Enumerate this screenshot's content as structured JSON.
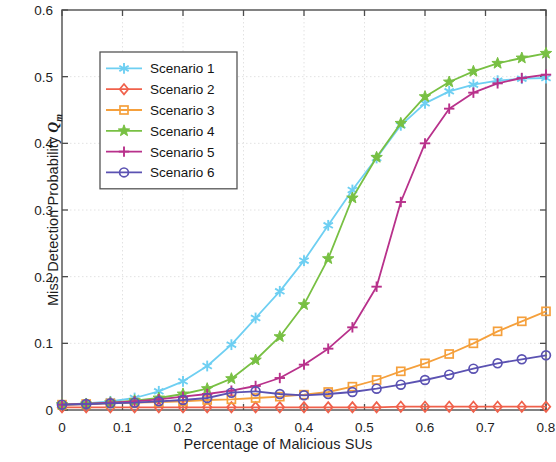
{
  "chart_data": {
    "type": "line",
    "title": "",
    "xlabel": "Percentage of Malicious SUs",
    "ylabel": "Miss Detection Probability",
    "ylabel_symbol": "Q",
    "ylabel_symbol_sub": "m",
    "xlim": [
      0,
      0.8
    ],
    "ylim": [
      0,
      0.6
    ],
    "xticks": [
      0,
      0.1,
      0.2,
      0.3,
      0.4,
      0.5,
      0.6,
      0.7,
      0.8
    ],
    "xtick_labels": [
      "0",
      "0.1",
      "0.2",
      "0.3",
      "0.4",
      "0.5",
      "0.6",
      "0.7",
      "0.8"
    ],
    "yticks": [
      0,
      0.1,
      0.2,
      0.3,
      0.4,
      0.5,
      0.6
    ],
    "ytick_labels": [
      "0",
      "0.1",
      "0.2",
      "0.3",
      "0.4",
      "0.5",
      "0.6"
    ],
    "grid": true,
    "legend_position": "upper-left-inset",
    "x": [
      0,
      0.04,
      0.08,
      0.12,
      0.16,
      0.2,
      0.24,
      0.28,
      0.32,
      0.36,
      0.4,
      0.44,
      0.48,
      0.52,
      0.56,
      0.6,
      0.64,
      0.68,
      0.72,
      0.76,
      0.8
    ],
    "series": [
      {
        "name": "Scenario 1",
        "color": "#6ecff2",
        "marker": "asterisk",
        "values": [
          0.008,
          0.01,
          0.013,
          0.018,
          0.028,
          0.043,
          0.066,
          0.098,
          0.138,
          0.178,
          0.224,
          0.277,
          0.33,
          0.378,
          0.427,
          0.46,
          0.478,
          0.488,
          0.494,
          0.497,
          0.498
        ]
      },
      {
        "name": "Scenario 2",
        "color": "#f0614b",
        "marker": "diamond",
        "values": [
          0.004,
          0.004,
          0.004,
          0.004,
          0.004,
          0.004,
          0.004,
          0.004,
          0.004,
          0.004,
          0.004,
          0.004,
          0.004,
          0.004,
          0.005,
          0.005,
          0.005,
          0.005,
          0.005,
          0.005,
          0.005
        ]
      },
      {
        "name": "Scenario 3",
        "color": "#f5a03c",
        "marker": "square",
        "values": [
          0.008,
          0.009,
          0.01,
          0.011,
          0.012,
          0.013,
          0.015,
          0.016,
          0.018,
          0.02,
          0.023,
          0.027,
          0.035,
          0.045,
          0.058,
          0.07,
          0.084,
          0.1,
          0.118,
          0.133,
          0.148
        ]
      },
      {
        "name": "Scenario 4",
        "color": "#78c043",
        "marker": "star",
        "values": [
          0.008,
          0.009,
          0.011,
          0.014,
          0.018,
          0.024,
          0.032,
          0.047,
          0.075,
          0.11,
          0.158,
          0.227,
          0.318,
          0.379,
          0.43,
          0.47,
          0.492,
          0.508,
          0.52,
          0.528,
          0.535
        ]
      },
      {
        "name": "Scenario 5",
        "color": "#b8318b",
        "marker": "plus",
        "values": [
          0.008,
          0.009,
          0.011,
          0.013,
          0.016,
          0.02,
          0.024,
          0.029,
          0.036,
          0.048,
          0.068,
          0.092,
          0.124,
          0.185,
          0.312,
          0.4,
          0.452,
          0.476,
          0.49,
          0.498,
          0.503
        ]
      },
      {
        "name": "Scenario 6",
        "color": "#5b52b2",
        "marker": "circle",
        "values": [
          0.008,
          0.009,
          0.01,
          0.011,
          0.013,
          0.015,
          0.018,
          0.026,
          0.028,
          0.024,
          0.022,
          0.024,
          0.027,
          0.032,
          0.038,
          0.045,
          0.053,
          0.062,
          0.07,
          0.076,
          0.082
        ]
      }
    ]
  },
  "legend": {
    "entries": [
      {
        "label": "Scenario 1"
      },
      {
        "label": "Scenario 2"
      },
      {
        "label": "Scenario 3"
      },
      {
        "label": "Scenario 4"
      },
      {
        "label": "Scenario 5"
      },
      {
        "label": "Scenario 6"
      }
    ]
  },
  "style": {
    "axis_color": "#4d4d4d",
    "grid_color": "#e2e2e2",
    "background": "#ffffff",
    "legend_border": "#555555"
  }
}
